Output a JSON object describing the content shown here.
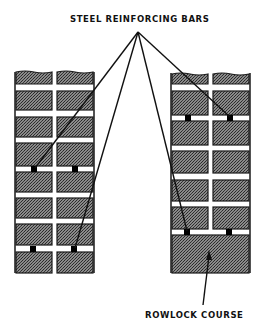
{
  "diagram": {
    "labels": {
      "top": "STEEL REINFORCING BARS",
      "bottom": "ROWLOCK COURSE"
    },
    "walls": [
      {
        "name": "left-wall",
        "description": "Reinforced brick wall with bars in bed joints",
        "bar_rows_y": [
          169,
          249
        ],
        "bar_x": [
          34,
          75
        ]
      },
      {
        "name": "right-wall",
        "description": "Reinforced brick wall ending in rowlock course",
        "bar_rows_y": [
          118,
          232
        ],
        "bar_x": [
          188,
          230
        ],
        "rowlock_course": true
      }
    ],
    "colors": {
      "brick_fill": "#6e6e6e",
      "joint": "#ffffff",
      "outline": "#1a1a1a",
      "leader": "#111111"
    }
  }
}
